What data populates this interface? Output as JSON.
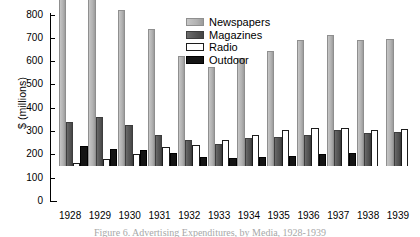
{
  "axis": {
    "ylabel": "$ (millions)",
    "yticks": [
      0,
      100,
      200,
      300,
      400,
      500,
      600,
      700,
      800
    ]
  },
  "caption": "Figure 6. Advertising Expenditures, by Media, 1928-1939",
  "colors": {
    "newspapers": "#b2b2b2",
    "magazines": "#525252",
    "radio": "#ffffff",
    "outdoor": "#141414",
    "axis": "#000000",
    "background": "#ffffff"
  },
  "chart_data": {
    "type": "bar",
    "title": "",
    "xlabel": "",
    "ylabel": "$ (millions)",
    "ylim": [
      0,
      800
    ],
    "grid": false,
    "legend_position": "top-right",
    "categories": [
      "1928",
      "1929",
      "1930",
      "1931",
      "1932",
      "1933",
      "1934",
      "1935",
      "1936",
      "1937",
      "1938",
      "1939"
    ],
    "series": [
      {
        "key": "newspapers",
        "name": "Newspapers",
        "color": "#b2b2b2",
        "values": [
          720,
          760,
          670,
          590,
          470,
          425,
          465,
          495,
          540,
          560,
          540,
          545
        ]
      },
      {
        "key": "magazines",
        "name": "Magazines",
        "color": "#525252",
        "values": [
          190,
          210,
          175,
          135,
          110,
          95,
          120,
          125,
          135,
          155,
          140,
          145
        ]
      },
      {
        "key": "radio",
        "name": "Radio",
        "color": "#ffffff",
        "values": [
          15,
          30,
          50,
          80,
          90,
          110,
          135,
          155,
          165,
          165,
          155,
          160
        ]
      },
      {
        "key": "outdoor",
        "name": "Outdoor",
        "color": "#141414",
        "values": [
          85,
          75,
          70,
          55,
          40,
          35,
          40,
          45,
          50,
          55,
          null,
          null
        ]
      }
    ]
  }
}
